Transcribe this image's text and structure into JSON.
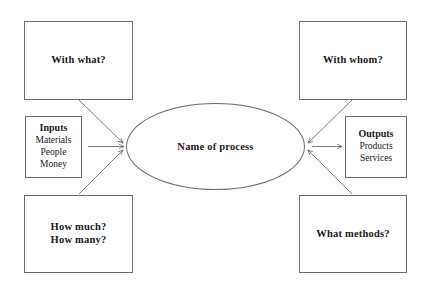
{
  "diagram": {
    "stroke_color": "#6e6e6e",
    "text_color": "#1a1a1a",
    "background_color": "#ffffff",
    "center": {
      "shape": "ellipse",
      "label": "Name of process"
    },
    "question_boxes": [
      {
        "id": "with-what",
        "position": "top-left",
        "lines": [
          "With what?"
        ]
      },
      {
        "id": "with-whom",
        "position": "top-right",
        "lines": [
          "With whom?"
        ]
      },
      {
        "id": "how-much",
        "position": "bottom-left",
        "lines": [
          "How much?",
          "How many?"
        ]
      },
      {
        "id": "what-methods",
        "position": "bottom-right",
        "lines": [
          "What methods?"
        ]
      }
    ],
    "io_boxes": [
      {
        "id": "inputs",
        "position": "left",
        "title": "Inputs",
        "items": [
          "Materials",
          "People",
          "Money"
        ]
      },
      {
        "id": "outputs",
        "position": "right",
        "title": "Outputs",
        "items": [
          "Products",
          "Services"
        ]
      }
    ],
    "connectors": [
      {
        "from": "inputs",
        "to": "process",
        "style": "arrow",
        "direction": "right"
      },
      {
        "from": "process",
        "to": "outputs",
        "style": "arrow",
        "direction": "right"
      },
      {
        "from": "with-what",
        "to": "process",
        "style": "arrow",
        "direction": "diagonal-down-right"
      },
      {
        "from": "how-much",
        "to": "process",
        "style": "arrow",
        "direction": "diagonal-up-right"
      },
      {
        "from": "with-whom",
        "to": "process",
        "style": "arrow",
        "direction": "diagonal-down-left"
      },
      {
        "from": "what-methods",
        "to": "process",
        "style": "arrow",
        "direction": "diagonal-up-left"
      }
    ]
  }
}
